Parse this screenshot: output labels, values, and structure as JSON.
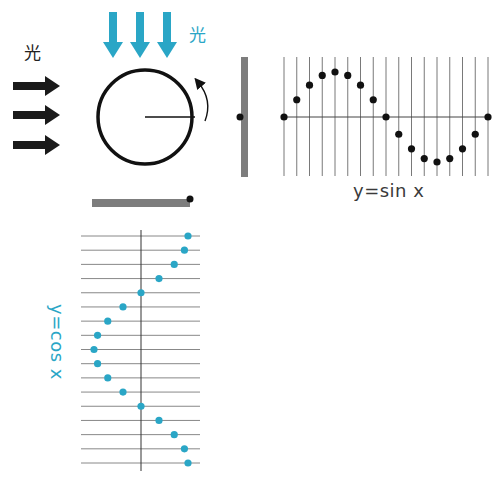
{
  "labels": {
    "light_left": "光",
    "light_top": "光",
    "sin_caption": "y=sin x",
    "cos_caption": "y=cos x"
  },
  "colors": {
    "black": "#111111",
    "teal": "#2aa6c6",
    "bar_gray": "#7d7d7d",
    "grid_gray": "#6a6a6a"
  },
  "icons": {
    "left_arrows": "right-arrow-icon",
    "top_arrows": "down-arrow-icon",
    "rotation": "counterclockwise-arrow-icon"
  },
  "circle": {
    "cx": 145,
    "cy": 117,
    "r": 47
  },
  "shadow_bars": {
    "vertical": {
      "x": 241,
      "y": 57,
      "w": 7,
      "h": 120,
      "dot_y": 117
    },
    "horizontal": {
      "x": 92,
      "y": 199,
      "w": 98,
      "h": 8,
      "dot_x": 190
    }
  },
  "chart_data": [
    {
      "type": "scatter",
      "title": "y=sin x",
      "xlabel": "",
      "ylabel": "",
      "x_steps": 17,
      "x": [
        0,
        22.5,
        45,
        67.5,
        90,
        112.5,
        135,
        157.5,
        180,
        202.5,
        225,
        247.5,
        270,
        292.5,
        315,
        337.5,
        360
      ],
      "values": [
        0,
        0.383,
        0.707,
        0.924,
        1,
        0.924,
        0.707,
        0.383,
        0,
        -0.383,
        -0.707,
        -0.924,
        -1,
        -0.924,
        -0.707,
        -0.383,
        0
      ],
      "ylim": [
        -1,
        1
      ],
      "grid": "vertical lines at each sample",
      "marker_color": "#111111"
    },
    {
      "type": "scatter",
      "title": "y=cos x",
      "orientation": "rotated (x axis runs downward)",
      "x": [
        0,
        22.5,
        45,
        67.5,
        90,
        112.5,
        135,
        157.5,
        180,
        202.5,
        225,
        247.5,
        270,
        292.5,
        315,
        337.5,
        360
      ],
      "values": [
        1,
        0.924,
        0.707,
        0.383,
        0,
        -0.383,
        -0.707,
        -0.924,
        -1,
        -0.924,
        -0.707,
        -0.383,
        0,
        0.383,
        0.707,
        0.924,
        1
      ],
      "ylim": [
        -1,
        1
      ],
      "grid": "horizontal lines at each sample",
      "marker_color": "#2aa6c6"
    }
  ]
}
